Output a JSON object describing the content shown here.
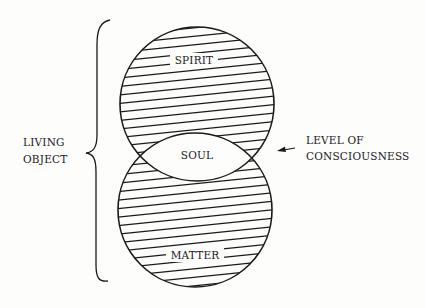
{
  "diagram": {
    "regions": {
      "upper": "SPIRIT",
      "middle": "SOUL",
      "lower": "MATTER"
    },
    "left_label": [
      "LIVING",
      "OBJECT"
    ],
    "right_label": [
      "LEVEL OF",
      "CONSCIOUSNESS"
    ],
    "colors": {
      "ink": "#1a1a1a",
      "paper": "#fdfdfc"
    }
  }
}
